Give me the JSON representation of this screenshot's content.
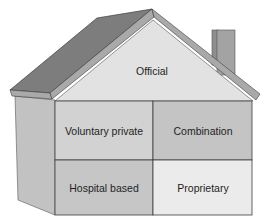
{
  "diagram": {
    "type": "house",
    "roof": {
      "label": "Official",
      "color": "#e2e2e2"
    },
    "rooms": [
      {
        "label": "Voluntary private",
        "color": "#d2d2d2"
      },
      {
        "label": "Combination",
        "color": "#c4c4c4"
      },
      {
        "label": "Hospital based",
        "color": "#c6c6c6"
      },
      {
        "label": "Proprietary",
        "color": "#ebebeb"
      }
    ],
    "colors": {
      "roof_slope": "#7d7d7d",
      "roof_edge": "#a9a9a9",
      "side_wall": "#c2c2c2",
      "chimney": "#a3a3a3",
      "outline": "#3c3c3c"
    }
  }
}
